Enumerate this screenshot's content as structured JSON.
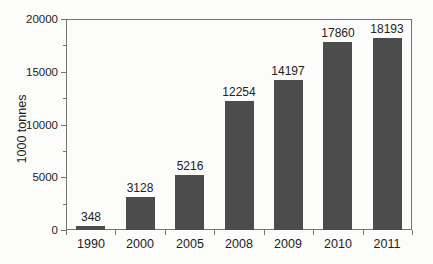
{
  "chart_data": {
    "type": "bar",
    "title": "",
    "xlabel": "",
    "ylabel": "1000 tonnes",
    "categories": [
      "1990",
      "2000",
      "2005",
      "2008",
      "2009",
      "2010",
      "2011"
    ],
    "values": [
      348,
      3128,
      5216,
      12254,
      14197,
      17860,
      18193
    ],
    "value_labels": [
      "348",
      "3128",
      "5216",
      "12254",
      "14197",
      "17860",
      "18193"
    ],
    "ylim": [
      0,
      20000
    ],
    "yticks": [
      0,
      5000,
      10000,
      15000,
      20000
    ],
    "ytick_labels": [
      "0",
      "5000",
      "10000",
      "15000",
      "20000"
    ],
    "y_minor_tick_step": 2500,
    "grid": false,
    "legend_position": "none",
    "colors": {
      "bar": "#4c4c4c",
      "axis": "#757575",
      "text": "#222222",
      "background": "#fcfcfb"
    }
  }
}
